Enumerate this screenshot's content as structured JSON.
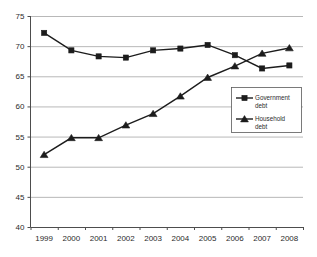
{
  "chart_data": {
    "type": "line",
    "title": "",
    "subtitle": "",
    "xlabel": "",
    "ylabel": "",
    "categories": [
      "1999",
      "2000",
      "2001",
      "2002",
      "2003",
      "2004",
      "2005",
      "2006",
      "2007",
      "2008"
    ],
    "series": [
      {
        "name": "Government debt",
        "marker": "square",
        "color": "#1c1c1c",
        "values": [
          72.2,
          69.3,
          68.3,
          68.1,
          69.3,
          69.6,
          70.2,
          68.5,
          66.3,
          66.8
        ]
      },
      {
        "name": "Household debt",
        "marker": "triangle",
        "color": "#1c1c1c",
        "values": [
          52.0,
          54.8,
          54.8,
          56.9,
          58.8,
          61.7,
          64.8,
          66.7,
          68.8,
          69.7
        ]
      }
    ],
    "ylim": [
      40,
      75
    ],
    "yticks": [
      40,
      45,
      50,
      55,
      60,
      65,
      70,
      75
    ],
    "ytick_labels": [
      "40",
      "45",
      "50",
      "55",
      "60",
      "65",
      "70",
      "75"
    ],
    "grid": true,
    "grid_axis": "y",
    "legend_position": "center-right",
    "legend_entries": [
      {
        "label_line1": "Government",
        "label_line2": "debt",
        "marker": "square"
      },
      {
        "label_line1": "Household",
        "label_line2": "debt",
        "marker": "triangle"
      }
    ]
  },
  "colors": {
    "background": "#ffffff",
    "gridline": "#a6a6a6",
    "axis": "#4d4d4d",
    "series": "#1c1c1c",
    "text": "#2b2b2b"
  }
}
